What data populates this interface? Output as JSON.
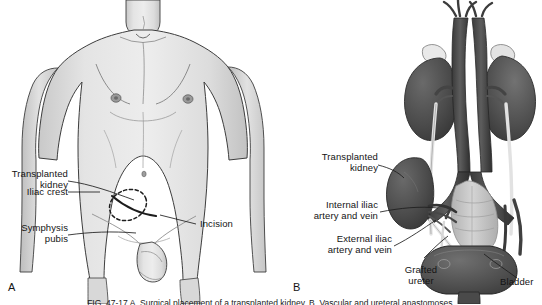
{
  "figure": {
    "domain_type": "medical-illustration",
    "caption": "FIG. 47-17  A, Surgical placement of a transplanted kidney.  B, Vascular and ureteral anastomoses.",
    "background_color": "#ffffff",
    "ink_color": "#141414"
  },
  "panels": [
    {
      "id": "A",
      "letter": "A",
      "title": "Anterior torso showing transplant site",
      "labels": [
        {
          "id": "transplanted-kidney-a",
          "text": "Transplanted\nkidney",
          "align": "right"
        },
        {
          "id": "iliac-crest",
          "text": "Iliac crest",
          "align": "right"
        },
        {
          "id": "symphysis-pubis",
          "text": "Symphysis\npubis",
          "align": "right"
        },
        {
          "id": "incision",
          "text": "Incision",
          "align": "left"
        }
      ]
    },
    {
      "id": "B",
      "letter": "B",
      "title": "Internal urinary anatomy with grafted kidney",
      "labels": [
        {
          "id": "transplanted-kidney-b",
          "text": "Transplanted\nkidney",
          "align": "right"
        },
        {
          "id": "internal-iliac-artery-vein",
          "text": "Internal iliac\nartery and vein",
          "align": "right"
        },
        {
          "id": "external-iliac-artery-vein",
          "text": "External iliac\nartery and vein",
          "align": "right"
        },
        {
          "id": "grafted-ureter",
          "text": "Grafted\nureter",
          "align": "center"
        },
        {
          "id": "bladder",
          "text": "Bladder",
          "align": "left"
        }
      ]
    }
  ],
  "palette": {
    "skin_light": "#e6e6e6",
    "skin_mid": "#d2d2d2",
    "skin_shadow": "#bdbdbd",
    "outline": "#3a3a3a",
    "organ_dark": "#4f4f4f",
    "organ_darker": "#3d3d3d",
    "organ_mid": "#6f6f6f",
    "organ_light": "#a8a8a8",
    "bone": "#c9c9c9",
    "vessel_light": "#dcdcdc",
    "leader": "#222222"
  }
}
